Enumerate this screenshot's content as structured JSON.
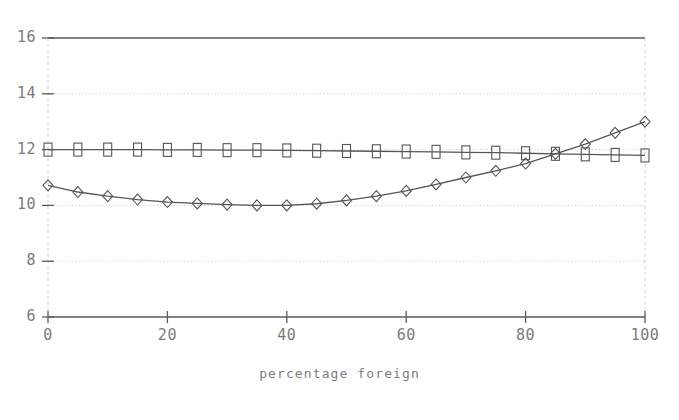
{
  "chart_data": {
    "type": "line",
    "title": "",
    "xlabel": "percentage foreign",
    "ylabel": "",
    "xlim": [
      0,
      100
    ],
    "ylim": [
      6,
      16
    ],
    "xticks": [
      0,
      20,
      40,
      60,
      80,
      100
    ],
    "yticks": [
      6,
      8,
      10,
      12,
      14,
      16
    ],
    "xtick_labels": [
      "0",
      "20",
      "40",
      "60",
      "80",
      "100"
    ],
    "ytick_labels": [
      "6",
      "8",
      "10",
      "12",
      "14",
      "16"
    ],
    "grid": true,
    "grid_style": "dotted",
    "legend": null,
    "series": [
      {
        "name": "squares",
        "marker": "square",
        "color": "#555555",
        "x": [
          0,
          5,
          10,
          15,
          20,
          25,
          30,
          35,
          40,
          45,
          50,
          55,
          60,
          65,
          70,
          75,
          80,
          85,
          90,
          95,
          100
        ],
        "values": [
          12.0,
          12.0,
          12.0,
          12.0,
          11.99,
          11.99,
          11.98,
          11.98,
          11.97,
          11.96,
          11.95,
          11.94,
          11.93,
          11.92,
          11.9,
          11.89,
          11.87,
          11.85,
          11.83,
          11.81,
          11.79
        ]
      },
      {
        "name": "diamonds",
        "marker": "diamond",
        "color": "#555555",
        "x": [
          0,
          5,
          10,
          15,
          20,
          25,
          30,
          35,
          40,
          45,
          50,
          55,
          60,
          65,
          70,
          75,
          80,
          85,
          90,
          95,
          100
        ],
        "values": [
          10.72,
          10.48,
          10.33,
          10.21,
          10.12,
          10.07,
          10.03,
          10.0,
          10.0,
          10.06,
          10.18,
          10.33,
          10.52,
          10.75,
          11.0,
          11.24,
          11.5,
          11.85,
          12.2,
          12.6,
          13.0
        ]
      }
    ]
  },
  "ticks": {
    "y": [
      {
        "label": "16",
        "value": 16
      },
      {
        "label": "14",
        "value": 14
      },
      {
        "label": "12",
        "value": 12
      },
      {
        "label": "10",
        "value": 10
      },
      {
        "label": "8",
        "value": 8
      },
      {
        "label": "6",
        "value": 6
      }
    ],
    "x": [
      {
        "label": "0",
        "value": 0
      },
      {
        "label": "20",
        "value": 20
      },
      {
        "label": "40",
        "value": 40
      },
      {
        "label": "60",
        "value": 60
      },
      {
        "label": "80",
        "value": 80
      },
      {
        "label": "100",
        "value": 100
      }
    ]
  },
  "colors": {
    "line": "#555555",
    "axis": "#5a5a5a",
    "grid": "#cfcfcf",
    "text": "#7a7a7a",
    "background": "#ffffff"
  }
}
